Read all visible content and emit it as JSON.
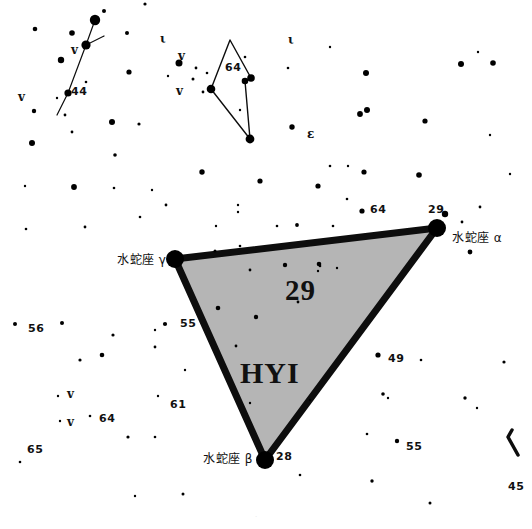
{
  "chart_title": "Hydrus constellation star chart",
  "canvas": {
    "width": 532,
    "height": 529,
    "background": "#ffffff"
  },
  "colors": {
    "star": "#000000",
    "boundary": "#0d0d0d",
    "fill": "#b5b5b5",
    "text": "#111111",
    "faint_text": "#e8e8e8"
  },
  "constellation": {
    "abbrev": "HYI",
    "area_number": "29",
    "fill_color": "#b5b5b5",
    "vertices": [
      {
        "id": "gamma",
        "name": "水蛇座 γ",
        "x": 175,
        "y": 259,
        "radius": 9,
        "label_side": "left"
      },
      {
        "id": "alpha",
        "name": "水蛇座 α",
        "x": 437,
        "y": 228,
        "radius": 9,
        "label_side": "right",
        "corner_number": "29"
      },
      {
        "id": "beta",
        "name": "水蛇座 β",
        "x": 265,
        "y": 460,
        "radius": 9,
        "label_side": "left",
        "corner_number": "28"
      }
    ]
  },
  "corner_numbers": [
    {
      "text": "29",
      "x": 428,
      "y": 204
    },
    {
      "text": "28",
      "x": 276,
      "y": 451
    }
  ],
  "star_names": [
    {
      "text": "水蛇座 γ",
      "x": 117,
      "y": 254
    },
    {
      "text": "水蛇座 α",
      "x": 452,
      "y": 232
    },
    {
      "text": "水蛇座 β",
      "x": 203,
      "y": 453
    }
  ],
  "big_labels": [
    {
      "text": "29",
      "x": 285,
      "y": 276
    },
    {
      "text": "HYI",
      "x": 240,
      "y": 358
    }
  ],
  "number_labels": [
    {
      "text": "44",
      "x": 71,
      "y": 86
    },
    {
      "text": "64",
      "x": 225,
      "y": 62
    },
    {
      "text": "64",
      "x": 370,
      "y": 204
    },
    {
      "text": "56",
      "x": 28,
      "y": 323
    },
    {
      "text": "55",
      "x": 180,
      "y": 318
    },
    {
      "text": "55",
      "x": 406,
      "y": 441
    },
    {
      "text": "49",
      "x": 388,
      "y": 353
    },
    {
      "text": "61",
      "x": 170,
      "y": 399
    },
    {
      "text": "64",
      "x": 99,
      "y": 413
    },
    {
      "text": "65",
      "x": 27,
      "y": 444
    },
    {
      "text": "45",
      "x": 508,
      "y": 481
    }
  ],
  "greek_labels": [
    {
      "text": "v",
      "x": 71,
      "y": 44
    },
    {
      "text": "v",
      "x": 18,
      "y": 91
    },
    {
      "text": "ι",
      "x": 160,
      "y": 33
    },
    {
      "text": "v",
      "x": 178,
      "y": 50
    },
    {
      "text": "v",
      "x": 176,
      "y": 85
    },
    {
      "text": "ι",
      "x": 288,
      "y": 34
    },
    {
      "text": "ε",
      "x": 307,
      "y": 128
    },
    {
      "text": "v",
      "x": 67,
      "y": 388
    },
    {
      "text": "v",
      "x": 67,
      "y": 416
    }
  ],
  "footer": {
    "text": "·",
    "x": 255,
    "y": 513
  },
  "chart_data": {
    "type": "scatter",
    "xlabel": "",
    "ylabel": "",
    "xlim": [
      0,
      532
    ],
    "ylim": [
      0,
      529
    ],
    "grid": false,
    "legend": "none",
    "boundary_polygon": [
      [
        175,
        259
      ],
      [
        437,
        228
      ],
      [
        265,
        460
      ]
    ],
    "boundary_stroke_width": 7,
    "stars": [
      {
        "x": 35,
        "y": 29,
        "r": 2.3
      },
      {
        "x": 61,
        "y": 60,
        "r": 3.2
      },
      {
        "x": 72,
        "y": 33,
        "r": 2.8
      },
      {
        "x": 86,
        "y": 45,
        "r": 4.6
      },
      {
        "x": 95,
        "y": 20,
        "r": 5.2
      },
      {
        "x": 104,
        "y": 11,
        "r": 2.0
      },
      {
        "x": 86,
        "y": 82,
        "r": 1.3
      },
      {
        "x": 57,
        "y": 98,
        "r": 1.2
      },
      {
        "x": 68,
        "y": 93,
        "r": 3.6
      },
      {
        "x": 127,
        "y": 33,
        "r": 2.0
      },
      {
        "x": 129,
        "y": 72,
        "r": 2.6
      },
      {
        "x": 65,
        "y": 115,
        "r": 1.4
      },
      {
        "x": 112,
        "y": 122,
        "r": 3.0
      },
      {
        "x": 139,
        "y": 124,
        "r": 1.6
      },
      {
        "x": 34,
        "y": 111,
        "r": 2.2
      },
      {
        "x": 32,
        "y": 143,
        "r": 3.0
      },
      {
        "x": 72,
        "y": 132,
        "r": 1.4
      },
      {
        "x": 179,
        "y": 63,
        "r": 3.5
      },
      {
        "x": 168,
        "y": 76,
        "r": 1.2
      },
      {
        "x": 193,
        "y": 79,
        "r": 1.5
      },
      {
        "x": 196,
        "y": 68,
        "r": 1.4
      },
      {
        "x": 207,
        "y": 73,
        "r": 1.3
      },
      {
        "x": 203,
        "y": 92,
        "r": 1.4
      },
      {
        "x": 211,
        "y": 89,
        "r": 4.3
      },
      {
        "x": 245,
        "y": 81,
        "r": 3.3
      },
      {
        "x": 251,
        "y": 78,
        "r": 3.8
      },
      {
        "x": 245,
        "y": 57,
        "r": 1.3
      },
      {
        "x": 240,
        "y": 110,
        "r": 1.2
      },
      {
        "x": 250,
        "y": 139,
        "r": 4.4
      },
      {
        "x": 288,
        "y": 68,
        "r": 1.3
      },
      {
        "x": 292,
        "y": 127,
        "r": 2.7
      },
      {
        "x": 330,
        "y": 47,
        "r": 1.2
      },
      {
        "x": 145,
        "y": 4,
        "r": 1.6
      },
      {
        "x": 115,
        "y": 155,
        "r": 1.8
      },
      {
        "x": 25,
        "y": 186,
        "r": 1.2
      },
      {
        "x": 26,
        "y": 229,
        "r": 1.3
      },
      {
        "x": 74,
        "y": 187,
        "r": 2.9
      },
      {
        "x": 85,
        "y": 227,
        "r": 1.4
      },
      {
        "x": 114,
        "y": 188,
        "r": 1.3
      },
      {
        "x": 140,
        "y": 217,
        "r": 1.3
      },
      {
        "x": 152,
        "y": 190,
        "r": 1.2
      },
      {
        "x": 166,
        "y": 205,
        "r": 1.4
      },
      {
        "x": 202,
        "y": 172,
        "r": 2.7
      },
      {
        "x": 216,
        "y": 226,
        "r": 1.2
      },
      {
        "x": 238,
        "y": 205,
        "r": 1.2
      },
      {
        "x": 238,
        "y": 212,
        "r": 1.2
      },
      {
        "x": 260,
        "y": 181,
        "r": 2.6
      },
      {
        "x": 277,
        "y": 226,
        "r": 1.3
      },
      {
        "x": 297,
        "y": 225,
        "r": 1.9
      },
      {
        "x": 318,
        "y": 186,
        "r": 2.6
      },
      {
        "x": 333,
        "y": 226,
        "r": 1.3
      },
      {
        "x": 347,
        "y": 199,
        "r": 1.3
      },
      {
        "x": 362,
        "y": 211,
        "r": 2.6
      },
      {
        "x": 364,
        "y": 172,
        "r": 2.6
      },
      {
        "x": 366,
        "y": 73,
        "r": 3.0
      },
      {
        "x": 367,
        "y": 110,
        "r": 3.0
      },
      {
        "x": 360,
        "y": 114,
        "r": 2.9
      },
      {
        "x": 461,
        "y": 64,
        "r": 3.0
      },
      {
        "x": 493,
        "y": 63,
        "r": 2.8
      },
      {
        "x": 478,
        "y": 52,
        "r": 1.2
      },
      {
        "x": 419,
        "y": 175,
        "r": 2.8
      },
      {
        "x": 425,
        "y": 121,
        "r": 2.6
      },
      {
        "x": 330,
        "y": 166,
        "r": 1.3
      },
      {
        "x": 348,
        "y": 166,
        "r": 1.2
      },
      {
        "x": 490,
        "y": 135,
        "r": 1.2
      },
      {
        "x": 510,
        "y": 174,
        "r": 1.2
      },
      {
        "x": 445,
        "y": 214,
        "r": 3.2
      },
      {
        "x": 462,
        "y": 222,
        "r": 1.4
      },
      {
        "x": 470,
        "y": 252,
        "r": 2.4
      },
      {
        "x": 480,
        "y": 207,
        "r": 1.4
      },
      {
        "x": 215,
        "y": 251,
        "r": 1.5
      },
      {
        "x": 240,
        "y": 246,
        "r": 1.3
      },
      {
        "x": 250,
        "y": 270,
        "r": 1.4
      },
      {
        "x": 285,
        "y": 265,
        "r": 2.2
      },
      {
        "x": 319,
        "y": 264,
        "r": 2.3
      },
      {
        "x": 318,
        "y": 271,
        "r": 1.2
      },
      {
        "x": 320,
        "y": 266,
        "r": 1.3
      },
      {
        "x": 337,
        "y": 268,
        "r": 1.2
      },
      {
        "x": 218,
        "y": 308,
        "r": 2.3
      },
      {
        "x": 256,
        "y": 317,
        "r": 2.2
      },
      {
        "x": 236,
        "y": 346,
        "r": 1.4
      },
      {
        "x": 298,
        "y": 302,
        "r": 1.4
      },
      {
        "x": 15,
        "y": 324,
        "r": 2.0
      },
      {
        "x": 62,
        "y": 323,
        "r": 2.0
      },
      {
        "x": 113,
        "y": 335,
        "r": 1.6
      },
      {
        "x": 80,
        "y": 360,
        "r": 1.6
      },
      {
        "x": 102,
        "y": 355,
        "r": 2.3
      },
      {
        "x": 165,
        "y": 324,
        "r": 2.1
      },
      {
        "x": 155,
        "y": 347,
        "r": 1.4
      },
      {
        "x": 185,
        "y": 370,
        "r": 1.2
      },
      {
        "x": 158,
        "y": 396,
        "r": 1.2
      },
      {
        "x": 155,
        "y": 330,
        "r": 1.2
      },
      {
        "x": 58,
        "y": 396,
        "r": 1.2
      },
      {
        "x": 60,
        "y": 421,
        "r": 1.2
      },
      {
        "x": 90,
        "y": 416,
        "r": 1.3
      },
      {
        "x": 128,
        "y": 437,
        "r": 1.6
      },
      {
        "x": 155,
        "y": 437,
        "r": 1.3
      },
      {
        "x": 135,
        "y": 496,
        "r": 1.2
      },
      {
        "x": 183,
        "y": 494,
        "r": 1.5
      },
      {
        "x": 20,
        "y": 462,
        "r": 1.3
      },
      {
        "x": 378,
        "y": 355,
        "r": 2.6
      },
      {
        "x": 421,
        "y": 360,
        "r": 1.3
      },
      {
        "x": 504,
        "y": 362,
        "r": 1.6
      },
      {
        "x": 383,
        "y": 394,
        "r": 1.8
      },
      {
        "x": 388,
        "y": 398,
        "r": 1.2
      },
      {
        "x": 465,
        "y": 398,
        "r": 1.7
      },
      {
        "x": 477,
        "y": 408,
        "r": 1.2
      },
      {
        "x": 367,
        "y": 434,
        "r": 1.3
      },
      {
        "x": 397,
        "y": 441,
        "r": 2.2
      },
      {
        "x": 372,
        "y": 481,
        "r": 1.7
      },
      {
        "x": 430,
        "y": 503,
        "r": 1.5
      },
      {
        "x": 250,
        "y": 403,
        "r": 1.2
      },
      {
        "x": 310,
        "y": 400,
        "r": 1.2
      },
      {
        "x": 300,
        "y": 475,
        "r": 1.3
      }
    ],
    "constellation_lines": [
      {
        "name": "reticulum-chain",
        "points": [
          [
            95,
            20
          ],
          [
            86,
            45
          ],
          [
            68,
            93
          ],
          [
            57,
            115
          ]
        ],
        "width": 1.2
      },
      {
        "name": "reticulum-spur",
        "points": [
          [
            86,
            45
          ],
          [
            104,
            36
          ]
        ],
        "width": 1.2
      },
      {
        "name": "kite-left",
        "points": [
          [
            211,
            89
          ],
          [
            230,
            40
          ],
          [
            251,
            78
          ]
        ],
        "width": 1.4
      },
      {
        "name": "kite-right",
        "points": [
          [
            251,
            78
          ],
          [
            245,
            81
          ],
          [
            250,
            139
          ]
        ],
        "width": 1.4
      },
      {
        "name": "kite-close",
        "points": [
          [
            211,
            89
          ],
          [
            250,
            139
          ]
        ],
        "width": 1.4
      },
      {
        "name": "boundary-right-edge",
        "points": [
          [
            518,
            455
          ],
          [
            508,
            437
          ],
          [
            512,
            430
          ]
        ],
        "width": 3.5
      }
    ]
  }
}
